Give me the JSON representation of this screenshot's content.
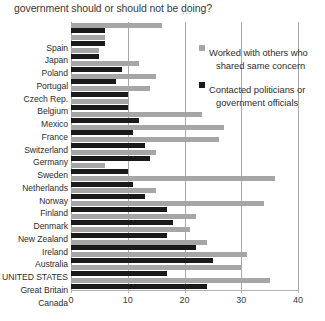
{
  "title": {
    "clipped_line": "do you think are things that the",
    "line": "government should or should not be doing?",
    "ellipsis": "..."
  },
  "legend": {
    "position": "top-right",
    "items": [
      {
        "name": "worked-with-others",
        "color": "#a6a6a6",
        "line1": "Worked with others who",
        "line2": "shared same concern"
      },
      {
        "name": "contacted-politicians",
        "color": "#1a1a1a",
        "line1": "Contacted politicians or",
        "line2": "government officials"
      }
    ]
  },
  "axis": {
    "ticks": [
      "0",
      "10",
      "20",
      "30",
      "40"
    ],
    "tick_values": [
      0,
      10,
      20,
      30,
      40
    ],
    "min": 0,
    "max": 40
  },
  "chart_data": {
    "type": "bar",
    "orientation": "horizontal",
    "title": "government should or should not be doing?",
    "xlabel": "",
    "ylabel": "",
    "xlim": [
      0,
      40
    ],
    "grid": true,
    "legend_position": "top-right",
    "categories": [
      "Spain",
      "Japan",
      "Poland",
      "Portugal",
      "Czech Rep.",
      "Belgium",
      "Mexico",
      "France",
      "Switzerland",
      "Germany",
      "Sweden",
      "Netherlands",
      "Norway",
      "Finland",
      "Denmark",
      "New Zealand",
      "Ireland",
      "Australia",
      "UNITED STATES",
      "Great Britain",
      "Canada"
    ],
    "series": [
      {
        "name": "Worked with others who shared same concern",
        "color": "#a6a6a6",
        "values": [
          16,
          6,
          5,
          12,
          15,
          14,
          10,
          23,
          27,
          26,
          15,
          6,
          36,
          15,
          34,
          22,
          21,
          24,
          31,
          30,
          35
        ]
      },
      {
        "name": "Contacted politicians or government officials",
        "color": "#1a1a1a",
        "values": [
          6,
          6,
          5,
          9,
          8,
          10,
          10,
          12,
          11,
          13,
          14,
          10,
          11,
          13,
          17,
          18,
          17,
          22,
          25,
          17,
          24
        ]
      }
    ]
  }
}
